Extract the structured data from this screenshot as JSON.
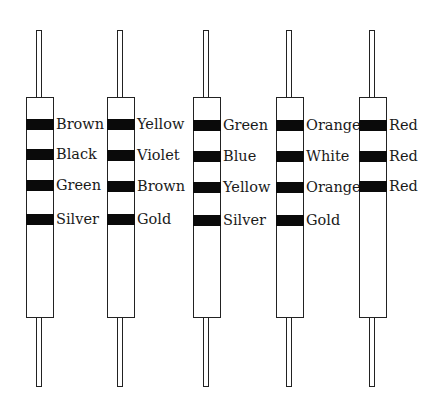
{
  "diagram": {
    "type": "resistor-color-codes",
    "resistors": [
      {
        "index": 1,
        "body_x": 26,
        "bands": [
          {
            "color": "Brown",
            "y": 119
          },
          {
            "color": "Black",
            "y": 149
          },
          {
            "color": "Green",
            "y": 180
          },
          {
            "color": "Silver",
            "y": 214
          }
        ]
      },
      {
        "index": 2,
        "body_x": 107,
        "bands": [
          {
            "color": "Yellow",
            "y": 119
          },
          {
            "color": "Violet",
            "y": 150
          },
          {
            "color": "Brown",
            "y": 181
          },
          {
            "color": "Gold",
            "y": 214
          }
        ]
      },
      {
        "index": 3,
        "body_x": 193,
        "bands": [
          {
            "color": "Green",
            "y": 120
          },
          {
            "color": "Blue",
            "y": 151
          },
          {
            "color": "Yellow",
            "y": 182
          },
          {
            "color": "Silver",
            "y": 215
          }
        ]
      },
      {
        "index": 4,
        "body_x": 276,
        "bands": [
          {
            "color": "Orange",
            "y": 120
          },
          {
            "color": "White",
            "y": 151
          },
          {
            "color": "Orange",
            "y": 182
          },
          {
            "color": "Gold",
            "y": 215
          }
        ]
      },
      {
        "index": 5,
        "body_x": 359,
        "bands": [
          {
            "color": "Red",
            "y": 120
          },
          {
            "color": "Red",
            "y": 151
          },
          {
            "color": "Red",
            "y": 181
          }
        ]
      }
    ]
  },
  "labels": {
    "r1": [
      "Brown",
      "Black",
      "Green",
      "Silver"
    ],
    "r2": [
      "Yellow",
      "Violet",
      "Brown",
      "Gold"
    ],
    "r3": [
      "Green",
      "Blue",
      "Yellow",
      "Silver"
    ],
    "r4": [
      "Orange",
      "White",
      "Orange",
      "Gold"
    ],
    "r5": [
      "Red",
      "Red",
      "Red"
    ]
  }
}
